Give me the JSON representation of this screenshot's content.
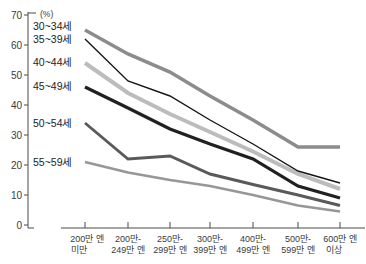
{
  "chart_data": {
    "type": "line",
    "title": "",
    "unit_label": "(%)",
    "xlabel": "",
    "ylabel": "%",
    "ylim": [
      0,
      70
    ],
    "y_tick_step": 10,
    "y_ticks": [
      "70",
      "60",
      "50",
      "40",
      "30",
      "20",
      "10",
      "0"
    ],
    "grid": false,
    "legend_position": "inline-left-at-line-start",
    "axis_color": "#4a4a4a",
    "categories": [
      {
        "line1": "200만 엔",
        "line2": "미만"
      },
      {
        "line1": "200만-",
        "line2": "249만 엔"
      },
      {
        "line1": "250만-",
        "line2": "299만 엔"
      },
      {
        "line1": "300만-",
        "line2": "399만 엔"
      },
      {
        "line1": "400만-",
        "line2": "499만 엔"
      },
      {
        "line1": "500만-",
        "line2": "599만 엔"
      },
      {
        "line1": "600만 엔",
        "line2": "이상"
      }
    ],
    "series": [
      {
        "label": "30~34세",
        "color": "#8c8c8c",
        "width": 3.6,
        "values": [
          65,
          57,
          51,
          43,
          35,
          26,
          26
        ]
      },
      {
        "label": "35~39세",
        "color": "#161616",
        "width": 1.4,
        "values": [
          62,
          48,
          43,
          35,
          27,
          18,
          14
        ]
      },
      {
        "label": "40~44세",
        "color": "#bcbcbc",
        "width": 4.0,
        "values": [
          54,
          44,
          37,
          31,
          24.5,
          17,
          12
        ]
      },
      {
        "label": "45~49세",
        "color": "#202020",
        "width": 3.2,
        "values": [
          46,
          39,
          32,
          27,
          22,
          13,
          9
        ]
      },
      {
        "label": "50~54세",
        "color": "#5a5a5a",
        "width": 2.9,
        "values": [
          34,
          22,
          23,
          17,
          13.5,
          10,
          6.5
        ]
      },
      {
        "label": "55~59세",
        "color": "#979797",
        "width": 2.7,
        "values": [
          21,
          17.5,
          15,
          13,
          10,
          6.5,
          4.5
        ]
      }
    ]
  }
}
